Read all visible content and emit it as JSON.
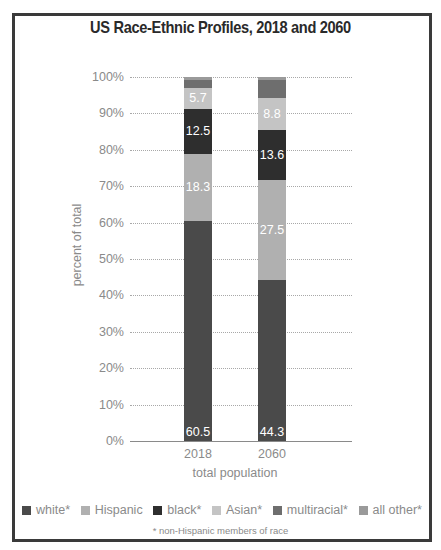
{
  "title": "US Race-Ethnic Profiles, 2018 and 2060",
  "y_axis": {
    "label": "percent of total",
    "ticks": [
      "100%",
      "90%",
      "80%",
      "70%",
      "60%",
      "50%",
      "40%",
      "30%",
      "20%",
      "10%",
      "0%"
    ]
  },
  "x_axis": {
    "label": "total population",
    "ticks": [
      "2018",
      "2060"
    ]
  },
  "legend": [
    {
      "label": "white*",
      "color": "#4a4a4a"
    },
    {
      "label": "Hispanic",
      "color": "#b0b0b0"
    },
    {
      "label": "black*",
      "color": "#2e2e2e"
    },
    {
      "label": "Asian*",
      "color": "#c4c4c4"
    },
    {
      "label": "multiracial*",
      "color": "#6e6e6e"
    },
    {
      "label": "all other*",
      "color": "#9a9a9a"
    }
  ],
  "footnote": "* non-Hispanic members of race",
  "bars": [
    {
      "year": "2018",
      "segments": [
        {
          "name": "white",
          "value": 60.5,
          "label": "60.5",
          "color": "#4a4a4a"
        },
        {
          "name": "Hispanic",
          "value": 18.3,
          "label": "18.3",
          "color": "#b0b0b0"
        },
        {
          "name": "black",
          "value": 12.5,
          "label": "12.5",
          "color": "#2e2e2e"
        },
        {
          "name": "Asian",
          "value": 5.7,
          "label": "5.7",
          "color": "#c4c4c4"
        },
        {
          "name": "multiracial",
          "value": 2.2,
          "label": "",
          "color": "#6e6e6e"
        },
        {
          "name": "all other",
          "value": 0.8,
          "label": "",
          "color": "#9a9a9a"
        }
      ]
    },
    {
      "year": "2060",
      "segments": [
        {
          "name": "white",
          "value": 44.3,
          "label": "44.3",
          "color": "#4a4a4a"
        },
        {
          "name": "Hispanic",
          "value": 27.5,
          "label": "27.5",
          "color": "#b0b0b0"
        },
        {
          "name": "black",
          "value": 13.6,
          "label": "13.6",
          "color": "#2e2e2e"
        },
        {
          "name": "Asian",
          "value": 8.8,
          "label": "8.8",
          "color": "#c4c4c4"
        },
        {
          "name": "multiracial",
          "value": 4.9,
          "label": "",
          "color": "#6e6e6e"
        },
        {
          "name": "all other",
          "value": 0.9,
          "label": "",
          "color": "#9a9a9a"
        }
      ]
    }
  ],
  "chart_data": {
    "type": "bar",
    "stacked": true,
    "title": "US Race-Ethnic Profiles, 2018 and 2060",
    "xlabel": "total population",
    "ylabel": "percent of total",
    "categories": [
      "2018",
      "2060"
    ],
    "ylim": [
      0,
      100
    ],
    "yticks": [
      "0%",
      "10%",
      "20%",
      "30%",
      "40%",
      "50%",
      "60%",
      "70%",
      "80%",
      "90%",
      "100%"
    ],
    "grid": true,
    "legend_position": "bottom",
    "series": [
      {
        "name": "white*",
        "values": [
          60.5,
          44.3
        ]
      },
      {
        "name": "Hispanic",
        "values": [
          18.3,
          27.5
        ]
      },
      {
        "name": "black*",
        "values": [
          12.5,
          13.6
        ]
      },
      {
        "name": "Asian*",
        "values": [
          5.7,
          8.8
        ]
      },
      {
        "name": "multiracial*",
        "values": [
          2.2,
          4.9
        ]
      },
      {
        "name": "all other*",
        "values": [
          0.8,
          0.9
        ]
      }
    ],
    "annotations": [
      "* non-Hispanic members of race"
    ]
  }
}
